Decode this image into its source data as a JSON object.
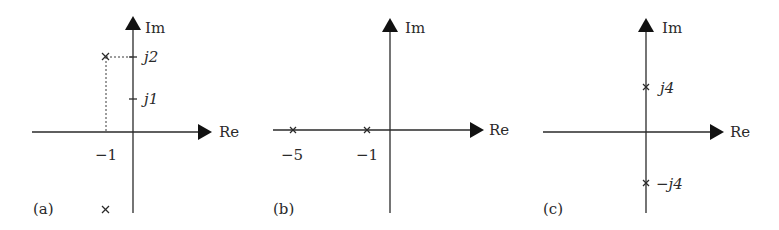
{
  "figure": {
    "panels": [
      {
        "id": "a",
        "label": "(a)",
        "axis_labels": {
          "real": "Re",
          "imag": "Im"
        },
        "tick_labels": {
          "j2": "j2",
          "j1": "j1",
          "neg1": "−1"
        },
        "poles": [
          {
            "re": -1,
            "im": 2
          },
          {
            "re": -1,
            "im": -2
          }
        ]
      },
      {
        "id": "b",
        "label": "(b)",
        "axis_labels": {
          "real": "Re",
          "imag": "Im"
        },
        "tick_labels": {
          "neg5": "−5",
          "neg1": "−1"
        },
        "poles": [
          {
            "re": -5,
            "im": 0
          },
          {
            "re": -1,
            "im": 0
          }
        ]
      },
      {
        "id": "c",
        "label": "(c)",
        "axis_labels": {
          "real": "Re",
          "imag": "Im"
        },
        "tick_labels": {
          "j4": "j4",
          "negj4": "−j4"
        },
        "poles": [
          {
            "re": 0,
            "im": 4
          },
          {
            "re": 0,
            "im": -4
          }
        ]
      }
    ],
    "colors": {
      "ink": "#2a2a2a",
      "background": "#ffffff"
    }
  }
}
